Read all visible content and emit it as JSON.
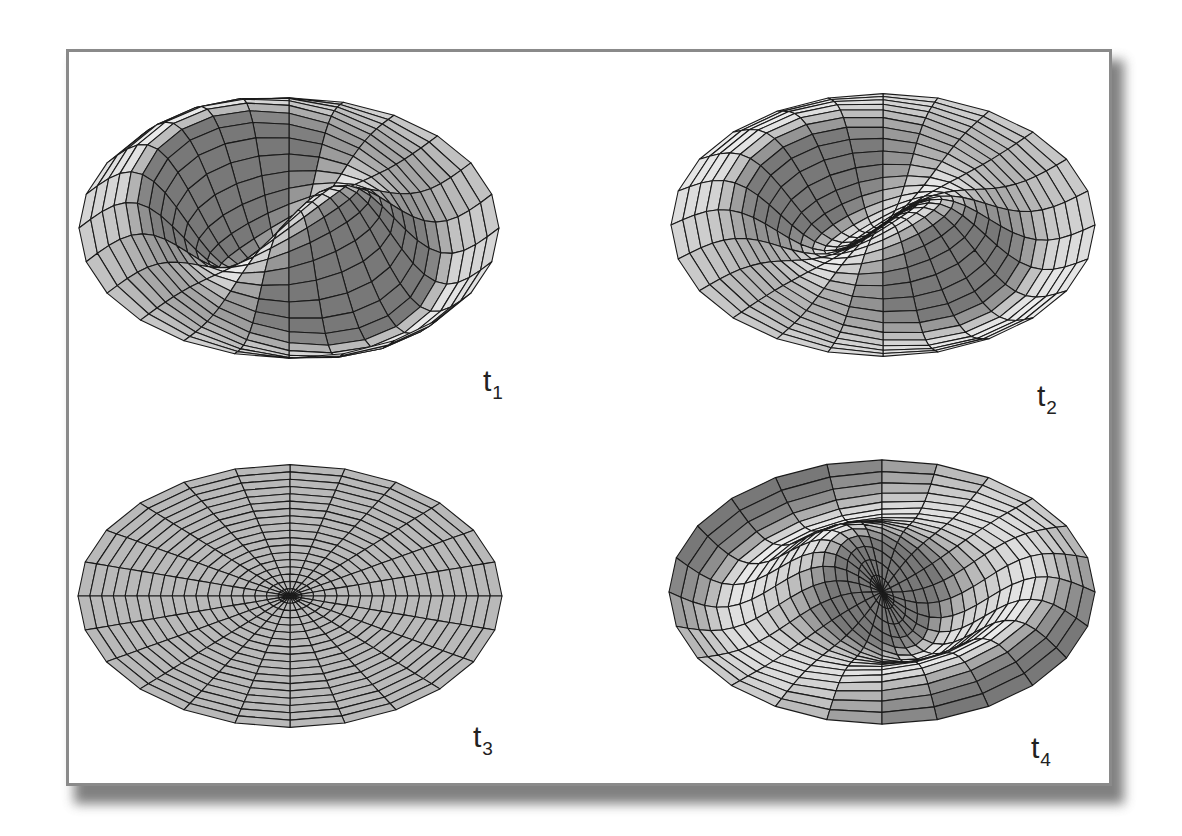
{
  "figure": {
    "panels": [
      {
        "id": "t1",
        "label": "t",
        "subscript": "1"
      },
      {
        "id": "t2",
        "label": "t",
        "subscript": "2"
      },
      {
        "id": "t3",
        "label": "t",
        "subscript": "3"
      },
      {
        "id": "t4",
        "label": "t",
        "subscript": "4"
      }
    ]
  },
  "chart_data": {
    "type": "surface",
    "title": "",
    "mesh": {
      "angular_segments": 24,
      "radial_rings": 18
    },
    "colors": {
      "face_light": "#e6e6e6",
      "face_mid": "#bdbdbd",
      "face_dark": "#8c8c8c",
      "edge": "#1a1a1a",
      "frame_border": "#8a8a8a"
    },
    "series": [
      {
        "name": "t1",
        "amplitude": 1.0,
        "phase_deg": 40,
        "center": [
          289,
          228
        ],
        "rx": 210,
        "ry": 150
      },
      {
        "name": "t2",
        "amplitude": 0.6,
        "phase_deg": 40,
        "center": [
          883,
          225
        ],
        "rx": 212,
        "ry": 148
      },
      {
        "name": "t3",
        "amplitude": 0.0,
        "phase_deg": 40,
        "center": [
          290,
          596
        ],
        "rx": 212,
        "ry": 153
      },
      {
        "name": "t4",
        "amplitude": -0.6,
        "phase_deg": 40,
        "center": [
          882,
          592
        ],
        "rx": 213,
        "ry": 151
      }
    ]
  }
}
